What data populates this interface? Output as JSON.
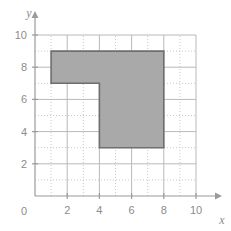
{
  "figure": {
    "background_color": "#ffffff",
    "axis_color": "#9a9a9a",
    "grid_major_color": "#b9b9b9",
    "grid_minor_color": "#c8c8c8",
    "label_color": "#8c8c8c"
  },
  "axes": {
    "x_name": "x",
    "y_name": "y",
    "origin_label": "0",
    "x_ticks": [
      {
        "value": 2,
        "label": "2"
      },
      {
        "value": 4,
        "label": "4"
      },
      {
        "value": 6,
        "label": "6"
      },
      {
        "value": 8,
        "label": "8"
      },
      {
        "value": 10,
        "label": "10"
      }
    ],
    "y_ticks": [
      {
        "value": 2,
        "label": "2"
      },
      {
        "value": 4,
        "label": "4"
      },
      {
        "value": 6,
        "label": "6"
      },
      {
        "value": 8,
        "label": "8"
      },
      {
        "value": 10,
        "label": "10"
      }
    ]
  },
  "chart_data": {
    "type": "scatter",
    "title": "",
    "xlabel": "x",
    "ylabel": "y",
    "xlim": [
      0,
      10.8
    ],
    "ylim": [
      0,
      10.8
    ],
    "grid": true,
    "grid_major_step": 2,
    "grid_minor_step": 1,
    "legend": "none",
    "shapes": [
      {
        "name": "L-shaped polygon",
        "kind": "polygon",
        "fill_color": "#a9a9a9",
        "fill_opacity": 1,
        "stroke_color": "#6e6e6e",
        "stroke_width": 1.6,
        "closed": true,
        "vertices": [
          {
            "x": 1,
            "y": 9
          },
          {
            "x": 8,
            "y": 9
          },
          {
            "x": 8,
            "y": 3
          },
          {
            "x": 4,
            "y": 3
          },
          {
            "x": 4,
            "y": 7
          },
          {
            "x": 1,
            "y": 7
          }
        ]
      }
    ]
  }
}
